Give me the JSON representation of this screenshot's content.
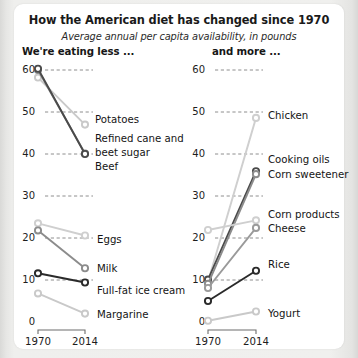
{
  "header": {
    "title": "How the American diet has changed since 1970",
    "subtitle": "Average annual per capita availability, in pounds",
    "left_panel_heading": "We're eating less ...",
    "right_panel_heading": "and more ..."
  },
  "axis": {
    "x_ticks": [
      "1970",
      "2014"
    ],
    "y_ticks": [
      "0",
      "10",
      "20",
      "30",
      "40",
      "50",
      "60"
    ],
    "y_min": 0,
    "y_max": 63,
    "grid": true
  },
  "chart_data": {
    "type": "line",
    "title": "How the American diet has changed since 1970",
    "subtitle": "Average annual per capita availability, in pounds",
    "xlabel": "",
    "ylabel": "Pounds per capita",
    "x": [
      "1970",
      "2014"
    ],
    "ylim": [
      0,
      63
    ],
    "grid": true,
    "legend": "right-of-line-endpoints",
    "panels": [
      {
        "name": "left",
        "heading": "We're eating less ...",
        "series": [
          {
            "name": "Potatoes",
            "values": [
              58.2,
              47.0
            ],
            "color": "#c9c9c9"
          },
          {
            "name": "Refined cane and beet sugar",
            "values": [
              60.0,
              40.1
            ],
            "color": "#8c8c8c"
          },
          {
            "name": "Beef",
            "values": [
              60.3,
              40.0
            ],
            "color": "#4a4a4a"
          },
          {
            "name": "Eggs",
            "values": [
              23.5,
              20.6
            ],
            "color": "#cfcfcf"
          },
          {
            "name": "Milk",
            "values": [
              21.8,
              12.8
            ],
            "color": "#8c8c8c"
          },
          {
            "name": "Full-fat ice cream",
            "values": [
              11.6,
              9.4
            ],
            "color": "#2a2a2a"
          },
          {
            "name": "Margarine",
            "values": [
              6.8,
              2.0
            ],
            "color": "#c9c9c9"
          }
        ]
      },
      {
        "name": "right",
        "heading": "and more ...",
        "series": [
          {
            "name": "Chicken",
            "values": [
              9.6,
              48.6
            ],
            "color": "#cfcfcf"
          },
          {
            "name": "Cooking oils",
            "values": [
              10.1,
              35.9
            ],
            "color": "#4a4a4a"
          },
          {
            "name": "Corn sweetener",
            "values": [
              9.1,
              35.2
            ],
            "color": "#8c8c8c"
          },
          {
            "name": "Corn products",
            "values": [
              21.9,
              24.2
            ],
            "color": "#cfcfcf"
          },
          {
            "name": "Cheese",
            "values": [
              8.1,
              22.4
            ],
            "color": "#9a9a9a"
          },
          {
            "name": "Rice",
            "values": [
              5.0,
              12.2
            ],
            "color": "#2a2a2a"
          },
          {
            "name": "Yogurt",
            "values": [
              0.3,
              2.5
            ],
            "color": "#c9c9c9"
          }
        ]
      }
    ]
  },
  "labels": {
    "left": [
      {
        "text": "Potatoes",
        "x": 95,
        "y": 120
      },
      {
        "text": "Refined cane and",
        "x": 95,
        "y": 139
      },
      {
        "text": "beet sugar",
        "x": 95,
        "y": 153
      },
      {
        "text": "Beef",
        "x": 95,
        "y": 167
      },
      {
        "text": "Eggs",
        "x": 97,
        "y": 240
      },
      {
        "text": "Milk",
        "x": 97,
        "y": 269
      },
      {
        "text": "Full-fat ice cream",
        "x": 97,
        "y": 291
      },
      {
        "text": "Margarine",
        "x": 97,
        "y": 315
      }
    ],
    "right": [
      {
        "text": "Chicken",
        "x": 268,
        "y": 116
      },
      {
        "text": "Cooking oils",
        "x": 268,
        "y": 160
      },
      {
        "text": "Corn sweetener",
        "x": 268,
        "y": 175
      },
      {
        "text": "Corn products",
        "x": 268,
        "y": 215
      },
      {
        "text": "Cheese",
        "x": 268,
        "y": 229
      },
      {
        "text": "Rice",
        "x": 268,
        "y": 265
      },
      {
        "text": "Yogurt",
        "x": 268,
        "y": 314
      }
    ]
  },
  "colors": {
    "card_background": "#ffffff",
    "page_background": "#e8e8e6",
    "gridline": "#8e8e8e",
    "axis": "#6d6d6d",
    "text": "#1a1a1a"
  }
}
